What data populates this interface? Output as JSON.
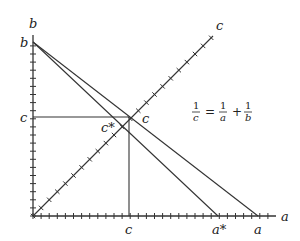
{
  "diagram": {
    "formula": {
      "lhs_num": "1",
      "lhs_den": "c",
      "eq": "=",
      "t1_num": "1",
      "t1_den": "a",
      "plus": "+",
      "t2_num": "1",
      "t2_den": "b"
    },
    "labels": {
      "y_axis": "b",
      "x_axis": "a",
      "diag_axis": "c",
      "b_point": "b",
      "c_y": "c",
      "c_point": "c",
      "c_star": "c*",
      "c_x": "c",
      "a_star": "a*",
      "a_point": "a"
    },
    "colors": {
      "line": "#333333",
      "text": "#222222",
      "background": "#ffffff"
    }
  }
}
